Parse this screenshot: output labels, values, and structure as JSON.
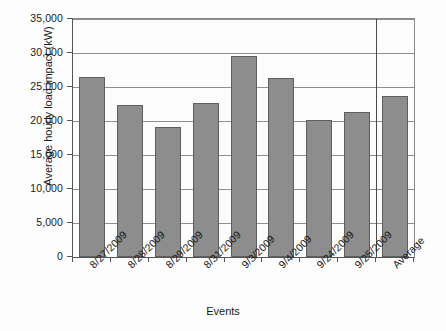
{
  "chart_data": {
    "type": "bar",
    "title": "",
    "xlabel": "Events",
    "ylabel": "Average hourly load impact (kW)",
    "categories": [
      "8/27/2009",
      "8/28/2009",
      "8/29/2009",
      "8/31/2009",
      "9/3/2009",
      "9/4/2009",
      "9/24/2009",
      "9/25/2009",
      "Average"
    ],
    "values": [
      26400,
      22300,
      19100,
      22600,
      29500,
      26300,
      20100,
      21300,
      23700
    ],
    "ylim": [
      0,
      35000
    ],
    "ytick_values": [
      0,
      5000,
      10000,
      15000,
      20000,
      25000,
      30000,
      35000
    ],
    "ytick_labels": [
      "0",
      "5,000",
      "10,000",
      "15,000",
      "20,000",
      "25,000",
      "30,000",
      "35,000"
    ],
    "grid": true,
    "legend": false,
    "legend_position": "none",
    "series": [
      {
        "name": "Average hourly load impact (kW)",
        "values": [
          26400,
          22300,
          19100,
          22600,
          29500,
          26300,
          20100,
          21300,
          23700
        ]
      }
    ],
    "annotations": [
      {
        "type": "vertical-divider",
        "after_category": "9/25/2009",
        "note": "separates the Average column from the event columns"
      }
    ],
    "colors": {
      "bar_fill": "#8d8d8d",
      "bar_border": "#5e5e5e",
      "gridline": "#8f8f8f",
      "axis": "#555555",
      "plot_background": "#fcfcfc",
      "figure_background": "#fdfdfd",
      "text": "#1a1a1a"
    }
  }
}
